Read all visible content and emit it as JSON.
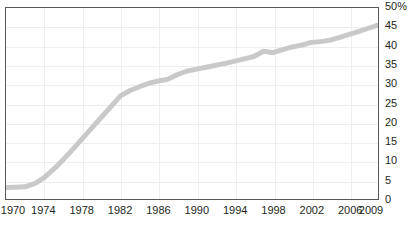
{
  "chart_data": {
    "type": "line",
    "title": "",
    "subtitle": "",
    "xlabel": "",
    "ylabel": "",
    "xlim": [
      1970,
      2009
    ],
    "ylim": [
      0,
      50
    ],
    "grid": true,
    "legend": null,
    "series_color": "#c9c9c9",
    "frame_color": "#58585a",
    "grid_color": "#eceff1",
    "text_color": "#231f20",
    "y_ticks": [
      {
        "value": 50,
        "label": "50%"
      },
      {
        "value": 45,
        "label": "45"
      },
      {
        "value": 40,
        "label": "40"
      },
      {
        "value": 35,
        "label": "35"
      },
      {
        "value": 30,
        "label": "30"
      },
      {
        "value": 25,
        "label": "25"
      },
      {
        "value": 20,
        "label": "20"
      },
      {
        "value": 15,
        "label": "15"
      },
      {
        "value": 10,
        "label": "10"
      },
      {
        "value": 5,
        "label": "5"
      },
      {
        "value": 0,
        "label": "0"
      }
    ],
    "x_ticks": [
      {
        "value": 1970,
        "label": "1970"
      },
      {
        "value": 1974,
        "label": "1974"
      },
      {
        "value": 1978,
        "label": "1978"
      },
      {
        "value": 1982,
        "label": "1982"
      },
      {
        "value": 1986,
        "label": "1986"
      },
      {
        "value": 1990,
        "label": "1990"
      },
      {
        "value": 1994,
        "label": "1994"
      },
      {
        "value": 1998,
        "label": "1998"
      },
      {
        "value": 2002,
        "label": "2002"
      },
      {
        "value": 2006,
        "label": "2006"
      },
      {
        "value": 2009,
        "label": "2009"
      }
    ],
    "x": [
      1970,
      1971,
      1972,
      1973,
      1974,
      1975,
      1976,
      1977,
      1978,
      1979,
      1980,
      1981,
      1982,
      1983,
      1984,
      1985,
      1986,
      1987,
      1988,
      1989,
      1990,
      1991,
      1992,
      1993,
      1994,
      1995,
      1996,
      1997,
      1998,
      1999,
      2000,
      2001,
      2002,
      2003,
      2004,
      2005,
      2006,
      2007,
      2008,
      2009
    ],
    "series": [
      {
        "name": "Percent",
        "values": [
          3.0,
          3.1,
          3.2,
          4.0,
          5.6,
          7.8,
          10.3,
          13.0,
          15.8,
          18.6,
          21.4,
          24.2,
          27.0,
          28.4,
          29.4,
          30.3,
          30.9,
          31.4,
          32.6,
          33.5,
          34.0,
          34.5,
          35.0,
          35.5,
          36.1,
          36.7,
          37.3,
          38.7,
          38.3,
          39.1,
          39.8,
          40.3,
          41.0,
          41.2,
          41.6,
          42.3,
          43.1,
          43.9,
          44.7,
          45.5
        ]
      }
    ]
  },
  "caption": {
    "sliver_text": ""
  }
}
